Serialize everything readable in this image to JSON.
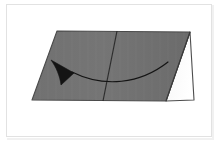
{
  "figure": {
    "type": "geometry-diagram",
    "caption": "",
    "background_color": "#ffffff",
    "frame_color": "#e2e2e2",
    "surface_gray": "#6f6f6f",
    "surface_gray_shade": "#747474",
    "facet_white": "#fbfbfb",
    "outline_color": "#4a4a4a",
    "crease_color": "#2b2b2b",
    "arrow_color": "#141414"
  },
  "shapes": {
    "top_face": {
      "name": "gray-top-face",
      "fill": "#6f6f6f",
      "points": "32,100 57,31 190,32 166,101"
    },
    "right_facet": {
      "name": "white-right-facet",
      "fill": "#fbfbfb",
      "points": "190,32 194,100 166,101"
    },
    "crease": {
      "name": "center-crease-line",
      "color": "#2b2b2b",
      "from": [
        117,
        31
      ],
      "to": [
        103,
        101
      ]
    },
    "right_ridge": {
      "name": "right-ridge-line",
      "color": "#3a3a3a",
      "from": [
        190,
        32
      ],
      "to": [
        166,
        101
      ]
    }
  },
  "arrow": {
    "name": "curved-motion-arrow",
    "color": "#141414",
    "direction": "right-to-left",
    "curve_path": "M 168,62 C 140,84 104,88 72,72",
    "head_points": "72,72 52,61 62,84",
    "stroke_width": 1.2
  },
  "labels": {
    "items": []
  }
}
